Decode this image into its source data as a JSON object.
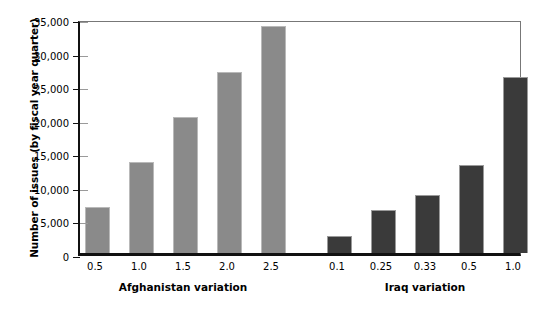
{
  "chart_data": {
    "type": "bar",
    "title": "",
    "subtitle": "",
    "xlabel": "",
    "ylabel": "Number of issues (by fiscal year quarter)",
    "ylim": [
      0,
      35000
    ],
    "ytick_labels": [
      "0",
      "5,000",
      "10,000",
      "15,000",
      "20,000",
      "25,000",
      "30,000",
      "35,000"
    ],
    "ytick_values": [
      0,
      5000,
      10000,
      15000,
      20000,
      25000,
      30000,
      35000
    ],
    "grid": false,
    "legend": "none",
    "groups": [
      {
        "name": "Afghanistan variation",
        "color": "#8a8a8a",
        "categories": [
          "0.5",
          "1.0",
          "1.5",
          "2.0",
          "2.5"
        ],
        "values": [
          6800,
          13500,
          20200,
          27000,
          33800
        ]
      },
      {
        "name": "Iraq variation",
        "color": "#3a3a3a",
        "categories": [
          "0.1",
          "0.25",
          "0.33",
          "0.5",
          "1.0"
        ],
        "values": [
          2500,
          6400,
          8600,
          13100,
          26200
        ]
      }
    ],
    "categories": [
      "0.5",
      "1.0",
      "1.5",
      "2.0",
      "2.5",
      "0.1",
      "0.25",
      "0.33",
      "0.5",
      "1.0"
    ],
    "values": [
      6800,
      13500,
      20200,
      27000,
      33800,
      2500,
      6400,
      8600,
      13100,
      26200
    ],
    "colors": {
      "afghanistan_bar": "#8a8a8a",
      "iraq_bar": "#3a3a3a",
      "axis": "#111111",
      "frame": "#777777",
      "background": "#ffffff"
    }
  }
}
